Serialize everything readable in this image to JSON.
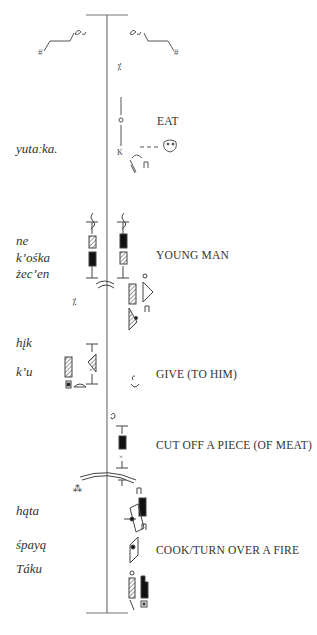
{
  "diagram": {
    "type": "sign-language-movement-notation",
    "staff": {
      "top_y": 15,
      "bottom_y": 613,
      "center_x": 107,
      "color": "#777777"
    },
    "words": [
      {
        "text": "yutaːka.",
        "y": 150
      },
      {
        "text": "ne",
        "y": 246
      },
      {
        "text": "k’ośka",
        "y": 262
      },
      {
        "text": "żec’en",
        "y": 278
      },
      {
        "text": "hįk",
        "y": 345
      },
      {
        "text": "k’u",
        "y": 373
      },
      {
        "text": "hąta",
        "y": 513
      },
      {
        "text": "śpayą",
        "y": 547
      },
      {
        "text": "Táku",
        "y": 570
      }
    ],
    "glosses": [
      {
        "text": "EAT",
        "y": 123
      },
      {
        "text": "YOUNG MAN",
        "y": 258
      },
      {
        "text": "GIVE (TO HIM)",
        "y": 376
      },
      {
        "text": "CUT OFF A PIECE (OF MEAT)",
        "y": 447
      },
      {
        "text": "COOK/TURN OVER A FIRE",
        "y": 552
      }
    ]
  }
}
